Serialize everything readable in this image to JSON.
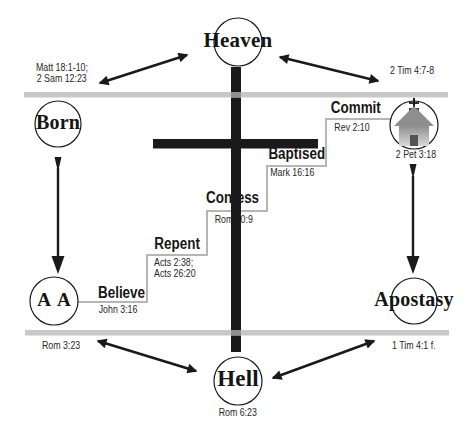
{
  "diagram": {
    "nodes": {
      "heaven": "Heaven",
      "born": "Born",
      "age_of_accountability": "A A",
      "apostasy": "Apostasy",
      "hell": "Hell"
    },
    "scriptures": {
      "heaven_left_line1": "Matt 18:1-10;",
      "heaven_left_line2": "2 Sam 12:23",
      "heaven_right": "2 Tim 4:7-8",
      "church": "2 Pet 3:18",
      "hell": "Rom 6:23",
      "fall_left": "Rom 3:23",
      "fall_right": "1 Tim 4:1 f."
    },
    "steps": [
      {
        "label": "Believe",
        "refs": [
          "John 3:16"
        ]
      },
      {
        "label": "Repent",
        "refs": [
          "Acts 2:38;",
          "Acts 26:20"
        ]
      },
      {
        "label": "Confess",
        "refs": [
          "Rom 10:9"
        ]
      },
      {
        "label": "Baptised",
        "refs": [
          "Mark 16:16"
        ]
      },
      {
        "label": "Commit",
        "refs": [
          "Rev 2:10"
        ]
      }
    ],
    "icons": {
      "church": "church-icon"
    },
    "colors": {
      "ink": "#1a1a1a",
      "divider_bar": "#c8c8c8",
      "staircase": "#b6b6b6",
      "background": "#ffffff"
    }
  }
}
